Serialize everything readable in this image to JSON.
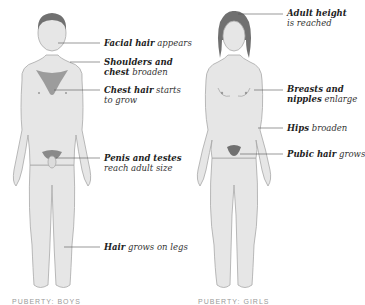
{
  "male": {
    "caption": "PUBERTY: BOYS",
    "labels": [
      {
        "bold": "Facial hair",
        "rest": " appears"
      },
      {
        "bold": "Shoulders and",
        "rest": ""
      },
      {
        "bold": "chest",
        "rest": " broaden"
      },
      {
        "bold": "Chest hair",
        "rest": " starts"
      },
      {
        "bold": "",
        "rest": "to grow"
      },
      {
        "bold": "Penis and testes",
        "rest": ""
      },
      {
        "bold": "",
        "rest": "reach adult size"
      },
      {
        "bold": "Hair",
        "rest": " grows on legs"
      }
    ]
  },
  "female": {
    "caption": "PUBERTY: GIRLS",
    "labels": [
      {
        "bold": "Adult height",
        "rest": ""
      },
      {
        "bold": "",
        "rest": "is reached"
      },
      {
        "bold": "Breasts and",
        "rest": ""
      },
      {
        "bold": "nipples",
        "rest": " enlarge"
      },
      {
        "bold": "Hips",
        "rest": " broaden"
      },
      {
        "bold": "Pubic hair",
        "rest": " grows"
      }
    ]
  },
  "colors": {
    "skin": "#e6e6e6",
    "outline": "#a8a8a8",
    "hair": "#707070",
    "body_hair": "#8a8a8a",
    "leader": "#555555"
  }
}
